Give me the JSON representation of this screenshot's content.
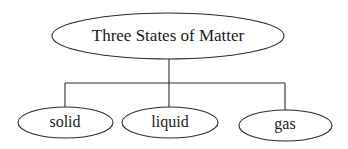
{
  "diagram": {
    "type": "tree",
    "root": {
      "label": "Three States of Matter"
    },
    "children": [
      {
        "label": "solid"
      },
      {
        "label": "liquid"
      },
      {
        "label": "gas"
      }
    ],
    "colors": {
      "stroke": "#2a2a2a",
      "fill": "#ffffff",
      "text": "#1a1a1a"
    }
  }
}
